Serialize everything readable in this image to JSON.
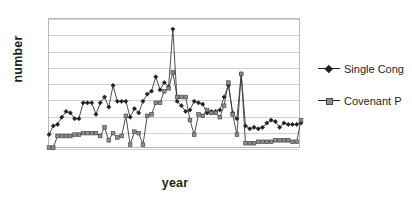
{
  "chart_data": {
    "type": "line",
    "title": "",
    "xlabel": "year",
    "ylabel": "number",
    "grid": true,
    "gridline_count": 8,
    "legend_position": "right",
    "axis_tick_labels": {
      "x": [],
      "y": []
    },
    "ylim": [
      0,
      9
    ],
    "x": [
      1,
      2,
      3,
      4,
      5,
      6,
      7,
      8,
      9,
      10,
      11,
      12,
      13,
      14,
      15,
      16,
      17,
      18,
      19,
      20,
      21,
      22,
      23,
      24,
      25,
      26,
      27,
      28,
      29,
      30,
      31,
      32,
      33,
      34,
      35,
      36,
      37,
      38,
      39,
      40,
      41,
      42,
      43,
      44,
      45,
      46,
      47,
      48,
      49,
      50,
      51,
      52,
      53,
      54,
      55,
      56,
      57,
      58,
      59,
      60
    ],
    "series": [
      {
        "name": "Single Cong",
        "marker": "diamond",
        "color": "#231f20",
        "values": [
          1.0,
          1.6,
          1.7,
          2.2,
          2.6,
          2.5,
          2.1,
          2.1,
          3.2,
          3.2,
          3.2,
          2.4,
          3.2,
          3.6,
          2.9,
          4.4,
          3.3,
          3.3,
          3.3,
          2.2,
          2.8,
          2.5,
          3.3,
          3.8,
          4.0,
          5.0,
          4.1,
          4.6,
          4.3,
          8.3,
          3.3,
          3.0,
          2.6,
          2.7,
          3.3,
          3.2,
          3.1,
          2.5,
          2.6,
          2.6,
          2.7,
          3.6,
          4.4,
          2.5,
          2.1,
          5.2,
          1.6,
          1.4,
          1.5,
          1.4,
          1.5,
          1.8,
          2.0,
          1.9,
          1.5,
          1.8,
          1.7,
          1.7,
          1.7,
          1.8
        ]
      },
      {
        "name": "Covenant P",
        "marker": "square",
        "color": "#8e8e8e",
        "values": [
          0.1,
          0.1,
          0.9,
          0.9,
          0.9,
          0.9,
          1.0,
          1.0,
          1.1,
          1.1,
          1.1,
          1.1,
          0.9,
          1.5,
          0.6,
          1.1,
          0.8,
          0.9,
          2.3,
          0.3,
          1.2,
          1.1,
          0.3,
          2.3,
          2.4,
          3.2,
          3.2,
          4.0,
          4.2,
          5.3,
          3.6,
          3.6,
          3.6,
          2.0,
          1.0,
          2.4,
          2.3,
          2.7,
          2.5,
          2.5,
          2.2,
          3.0,
          4.6,
          2.4,
          1.0,
          5.2,
          0.4,
          0.4,
          0.4,
          0.5,
          0.5,
          0.5,
          0.5,
          0.6,
          0.6,
          0.6,
          0.6,
          0.5,
          0.5,
          2.0
        ]
      }
    ]
  },
  "axes": {
    "y_title": "number",
    "x_title": "year"
  },
  "legend": {
    "entries": [
      {
        "label": "Single Cong",
        "marker": "diamond"
      },
      {
        "label": "Covenant P",
        "marker": "square"
      }
    ]
  }
}
